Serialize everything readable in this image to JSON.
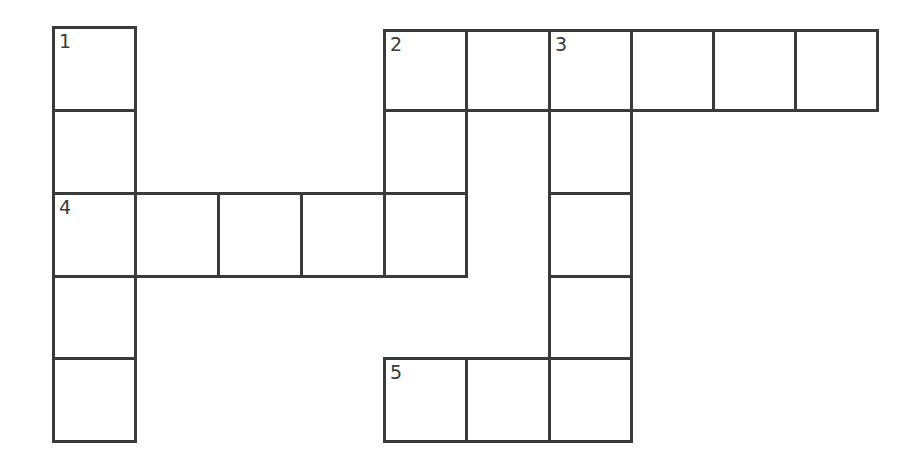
{
  "puzzle": {
    "type": "crossword",
    "rows": 5,
    "cols": 10,
    "line_color": "#3a3a3a",
    "background": "#ffffff",
    "cells": [
      {
        "row": 0,
        "col": 0,
        "number": "1",
        "letter": ""
      },
      {
        "row": 1,
        "col": 0,
        "number": "",
        "letter": ""
      },
      {
        "row": 2,
        "col": 0,
        "number": "4",
        "letter": ""
      },
      {
        "row": 3,
        "col": 0,
        "number": "",
        "letter": ""
      },
      {
        "row": 4,
        "col": 0,
        "number": "",
        "letter": ""
      },
      {
        "row": 2,
        "col": 1,
        "number": "",
        "letter": ""
      },
      {
        "row": 2,
        "col": 2,
        "number": "",
        "letter": ""
      },
      {
        "row": 2,
        "col": 3,
        "number": "",
        "letter": ""
      },
      {
        "row": 0,
        "col": 4,
        "number": "2",
        "letter": ""
      },
      {
        "row": 1,
        "col": 4,
        "number": "",
        "letter": ""
      },
      {
        "row": 2,
        "col": 4,
        "number": "",
        "letter": ""
      },
      {
        "row": 0,
        "col": 5,
        "number": "",
        "letter": ""
      },
      {
        "row": 0,
        "col": 6,
        "number": "3",
        "letter": ""
      },
      {
        "row": 1,
        "col": 6,
        "number": "",
        "letter": ""
      },
      {
        "row": 2,
        "col": 6,
        "number": "",
        "letter": ""
      },
      {
        "row": 3,
        "col": 6,
        "number": "",
        "letter": ""
      },
      {
        "row": 4,
        "col": 6,
        "number": "",
        "letter": ""
      },
      {
        "row": 0,
        "col": 7,
        "number": "",
        "letter": ""
      },
      {
        "row": 0,
        "col": 8,
        "number": "",
        "letter": ""
      },
      {
        "row": 0,
        "col": 9,
        "number": "",
        "letter": ""
      },
      {
        "row": 4,
        "col": 4,
        "number": "5",
        "letter": ""
      },
      {
        "row": 4,
        "col": 5,
        "number": "",
        "letter": ""
      }
    ],
    "entries": [
      {
        "number": "1",
        "direction": "down",
        "length": 5
      },
      {
        "number": "2",
        "direction": "across",
        "length": 6
      },
      {
        "number": "2",
        "direction": "down",
        "length": 3
      },
      {
        "number": "3",
        "direction": "down",
        "length": 5
      },
      {
        "number": "4",
        "direction": "across",
        "length": 5
      },
      {
        "number": "5",
        "direction": "across",
        "length": 3
      }
    ]
  }
}
